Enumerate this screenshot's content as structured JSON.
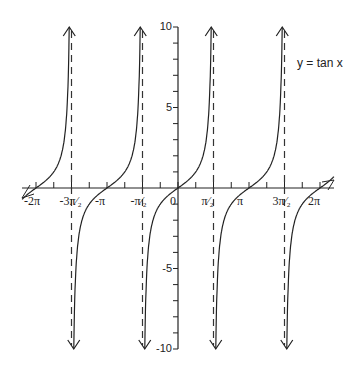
{
  "chart_data": {
    "type": "line",
    "title": "y = tan x",
    "xlabel": "",
    "ylabel": "",
    "series": [
      {
        "name": "y = tan x",
        "function": "tan(x)",
        "branches": [
          {
            "x_range": [
              "-5π/2",
              "-3π/2"
            ]
          },
          {
            "x_range": [
              "-3π/2",
              "-π/2"
            ]
          },
          {
            "x_range": [
              "-π/2",
              "π/2"
            ]
          },
          {
            "x_range": [
              "π/2",
              "3π/2"
            ]
          },
          {
            "x_range": [
              "3π/2",
              "5π/2"
            ]
          }
        ]
      }
    ],
    "asymptotes": [
      "-3π/2",
      "-π/2",
      "π/2",
      "3π/2"
    ],
    "asymptote_style": "dashed",
    "x_tick_labels": [
      "-2π",
      "-3π/2",
      "-π",
      "-π/2",
      "0",
      "π/2",
      "π",
      "3π/2",
      "2π"
    ],
    "x_tick_values": [
      -6.283,
      -4.712,
      -3.142,
      -1.571,
      0,
      1.571,
      3.142,
      4.712,
      6.283
    ],
    "y_tick_labels": [
      "10",
      "5",
      "-5",
      "-10"
    ],
    "y_tick_values": [
      10,
      5,
      -5,
      -10
    ],
    "xlim": [
      -6.9,
      6.9
    ],
    "ylim": [
      -10,
      10
    ],
    "grid": false,
    "legend": {
      "position": "top-right",
      "entries": [
        "y = tan x"
      ]
    },
    "arrows": "curves end in arrowheads at y = ±10"
  },
  "labels": {
    "title": "y = tan x",
    "x_ticks": [
      "-2π",
      "-3π/2",
      "-π",
      "-π/2",
      "0",
      "π/2",
      "π",
      "3π/2",
      "2π"
    ],
    "y_ticks": [
      "10",
      "5",
      "-5",
      "-10"
    ]
  }
}
